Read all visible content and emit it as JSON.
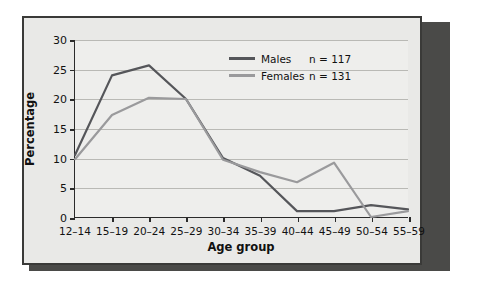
{
  "figure": {
    "background": "#e9e9e7",
    "plot_background": "#eeeeec",
    "frame_color": "#3a3a38",
    "shadow_color": "#4a4a48"
  },
  "legend": {
    "position": "top-right",
    "entries": [
      {
        "label": "Males",
        "count": "n = 117",
        "color": "#55565a"
      },
      {
        "label": "Females",
        "count": "n = 131",
        "color": "#9a9a9c"
      }
    ]
  },
  "chart_data": {
    "type": "line",
    "title": "",
    "xlabel": "Age group",
    "ylabel": "Percentage",
    "categories": [
      "12–14",
      "15–19",
      "20–24",
      "25–29",
      "30–34",
      "35–39",
      "40–44",
      "45–49",
      "50–54",
      "55–59"
    ],
    "ylim": [
      0,
      30
    ],
    "yticks": [
      0,
      5,
      10,
      15,
      20,
      25,
      30
    ],
    "ytick_labels": [
      "0",
      "5",
      "10",
      "15",
      "20",
      "25",
      "30"
    ],
    "grid": "horizontal",
    "series": [
      {
        "name": "Males",
        "count": "n = 117",
        "color": "#55565a",
        "values": [
          10.5,
          24.0,
          25.7,
          20.0,
          10.0,
          7.0,
          1.0,
          1.0,
          2.0,
          1.3
        ]
      },
      {
        "name": "Females",
        "count": "n = 131",
        "color": "#9a9a9c",
        "values": [
          9.8,
          17.3,
          20.2,
          20.0,
          9.7,
          7.6,
          5.9,
          9.2,
          0.0,
          1.0
        ]
      }
    ]
  }
}
